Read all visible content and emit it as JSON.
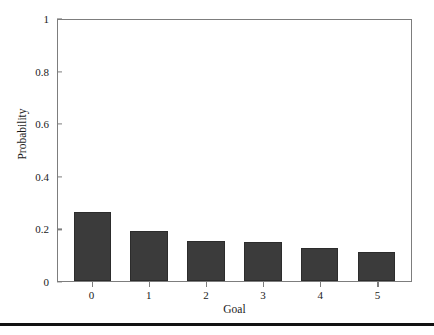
{
  "chart_data": {
    "type": "bar",
    "title": "",
    "xlabel": "Goal",
    "ylabel": "Probability",
    "categories": [
      "0",
      "1",
      "2",
      "3",
      "4",
      "5"
    ],
    "values": [
      0.265,
      0.19,
      0.155,
      0.148,
      0.127,
      0.112
    ],
    "ylim": [
      0,
      1
    ],
    "yticks": [
      "0",
      "0.2",
      "0.4",
      "0.6",
      "0.8",
      "1"
    ],
    "ytick_values": [
      0,
      0.2,
      0.4,
      0.6,
      0.8,
      1
    ],
    "xticks": [
      "0",
      "1",
      "2",
      "3",
      "4",
      "5"
    ],
    "grid": false,
    "legend": null,
    "bar_color": "#3b3b3b",
    "axis_color": "#7d7d7d",
    "background": "#ffffff"
  },
  "axes": {
    "x_title": "Goal",
    "y_title": "Probability"
  }
}
